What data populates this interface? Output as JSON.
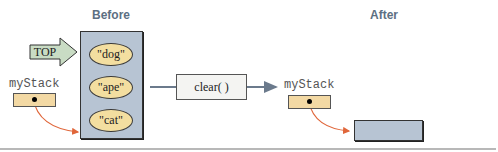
{
  "before": {
    "heading": "Before",
    "top_label": "TOP",
    "variable_label": "myStack",
    "stack_items": [
      "\"dog\"",
      "\"ape\"",
      "\"cat\""
    ]
  },
  "operation": {
    "label": "clear( )"
  },
  "after": {
    "heading": "After",
    "variable_label": "myStack",
    "stack_items": []
  },
  "colors": {
    "heading": "#5c6f82",
    "stack_box": "#b7c4d3",
    "node_fill": "#f3dea0",
    "reference_box": "#f3d9a4",
    "pointer_arrow": "#e0663a",
    "top_arrow": "#c9dcc4",
    "flow_line": "#6b7a8c"
  }
}
